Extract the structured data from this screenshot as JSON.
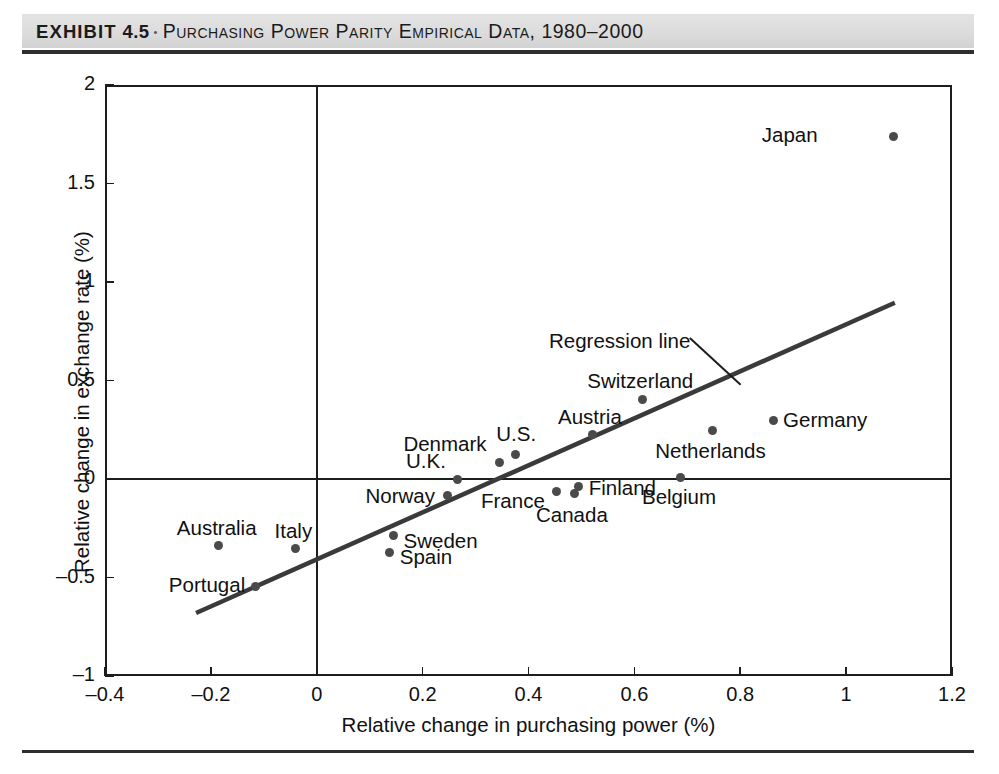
{
  "exhibit": {
    "label": "EXHIBIT",
    "number": "4.5",
    "separator": "•",
    "caption": "Purchasing Power Parity Empirical Data, 1980–2000"
  },
  "chart_data": {
    "type": "scatter",
    "title": "Purchasing Power Parity Empirical Data, 1980–2000",
    "xlabel": "Relative change in purchasing power (%)",
    "ylabel": "Relative change in exchange rate (%)",
    "xlim": [
      -0.4,
      1.2
    ],
    "ylim": [
      -1,
      2
    ],
    "xticks": [
      "-0.4",
      "-0.2",
      "0",
      "0.2",
      "0.4",
      "0.6",
      "0.8",
      "1",
      "1.2"
    ],
    "xtick_values": [
      -0.4,
      -0.2,
      0,
      0.2,
      0.4,
      0.6,
      0.8,
      1,
      1.2
    ],
    "yticks": [
      "2",
      "1.5",
      "1",
      "0.5",
      "0",
      "-0.5",
      "-1"
    ],
    "ytick_values": [
      2,
      1.5,
      1,
      0.5,
      0,
      -0.5,
      -1
    ],
    "grid": false,
    "legend": null,
    "zero_lines": {
      "horizontal": 0,
      "vertical": 0
    },
    "marker_color": "#4a4a4a",
    "line_color": "#3a3a3a",
    "axis_color": "#1d1d1d",
    "points": [
      {
        "name": "Japan",
        "x": 1.09,
        "y": 1.74,
        "label_pos": "left"
      },
      {
        "name": "Switzerland",
        "x": 0.615,
        "y": 0.405,
        "label_pos": "above"
      },
      {
        "name": "Austria",
        "x": 0.52,
        "y": 0.225,
        "label_pos": "above"
      },
      {
        "name": "Germany",
        "x": 0.862,
        "y": 0.295,
        "label_pos": "right"
      },
      {
        "name": "Netherlands",
        "x": 0.748,
        "y": 0.245,
        "label_pos": "below"
      },
      {
        "name": "U.S.",
        "x": 0.375,
        "y": 0.125,
        "label_pos": "above"
      },
      {
        "name": "Denmark",
        "x": 0.345,
        "y": 0.085,
        "label_pos": "left"
      },
      {
        "name": "U.K.",
        "x": 0.265,
        "y": 0.0,
        "label_pos": "left"
      },
      {
        "name": "Belgium",
        "x": 0.688,
        "y": 0.01,
        "label_pos": "below"
      },
      {
        "name": "Finland",
        "x": 0.495,
        "y": -0.04,
        "label_pos": "right"
      },
      {
        "name": "Canada",
        "x": 0.486,
        "y": -0.072,
        "label_pos": "below"
      },
      {
        "name": "France",
        "x": 0.452,
        "y": -0.065,
        "label_pos": "left"
      },
      {
        "name": "Norway",
        "x": 0.247,
        "y": -0.085,
        "label_pos": "left"
      },
      {
        "name": "Sweden",
        "x": 0.145,
        "y": -0.285,
        "label_pos": "right"
      },
      {
        "name": "Spain",
        "x": 0.138,
        "y": -0.375,
        "label_pos": "right"
      },
      {
        "name": "Italy",
        "x": -0.04,
        "y": -0.355,
        "label_pos": "above"
      },
      {
        "name": "Australia",
        "x": -0.185,
        "y": -0.34,
        "label_pos": "above"
      },
      {
        "name": "Portugal",
        "x": -0.115,
        "y": -0.545,
        "label_pos": "left"
      }
    ],
    "regression_line": {
      "label": "Regression line",
      "x_start": -0.228,
      "y_start": -0.68,
      "x_end": 1.092,
      "y_end": 0.895
    }
  }
}
